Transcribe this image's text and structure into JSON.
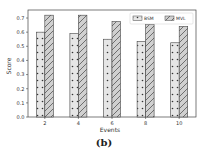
{
  "chart_data": {
    "type": "bar",
    "title": "",
    "xlabel": "Events",
    "ylabel": "Score",
    "categories": [
      "2",
      "4",
      "6",
      "8",
      "10"
    ],
    "series": [
      {
        "name": "BSM",
        "values": [
          0.6,
          0.59,
          0.55,
          0.535,
          0.525
        ],
        "pattern": "dots",
        "color": "#e6e6e6"
      },
      {
        "name": "MVL",
        "values": [
          0.72,
          0.72,
          0.675,
          0.655,
          0.64
        ],
        "pattern": "diagonal-hatch",
        "color": "#d0d0d0"
      }
    ],
    "ylim": [
      0.0,
      0.72
    ],
    "yticks": [
      "0.0",
      "0.1",
      "0.2",
      "0.3",
      "0.4",
      "0.5",
      "0.6",
      "0.7"
    ],
    "grid": false,
    "legend_position": "upper right"
  },
  "caption": "(b)"
}
